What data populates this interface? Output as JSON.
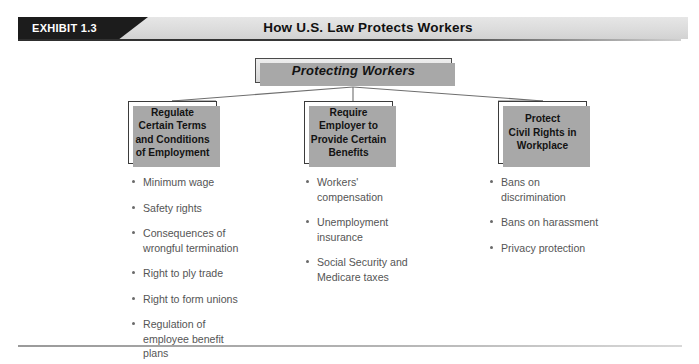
{
  "header": {
    "exhibit_tag": "EXHIBIT 1.3",
    "title": "How U.S. Law Protects Workers",
    "tag_bg_color": "#1c1c1c",
    "tag_text_color": "#ffffff",
    "band_bg_color": "#dcdcdc"
  },
  "diagram": {
    "root": {
      "label": "Protecting Workers"
    },
    "branches": [
      {
        "id": "regulate",
        "label": "Regulate\nCertain Terms\nand Conditions\nof Employment",
        "bullets": [
          "Minimum wage",
          "Safety rights",
          "Consequences of wrongful termination",
          "Right to ply trade",
          "Right to form unions",
          "Regulation of employee benefit plans"
        ]
      },
      {
        "id": "require",
        "label": "Require\nEmployer to\nProvide Certain\nBenefits",
        "bullets": [
          "Workers' compensation",
          "Unemployment insurance",
          "Social Security and Medicare taxes"
        ]
      },
      {
        "id": "protect",
        "label": "Protect\nCivil Rights in\nWorkplace",
        "bullets": [
          "Bans on discrimination",
          "Bans on harassment",
          "Privacy protection"
        ]
      }
    ],
    "connector_color": "#6e6e6e",
    "box_border_color": "#3b3b3b",
    "box_shadow_color": "#a8a8a8",
    "bullet_text_color": "#555555"
  },
  "footer": {
    "rule_color": "#9a9a9a"
  }
}
